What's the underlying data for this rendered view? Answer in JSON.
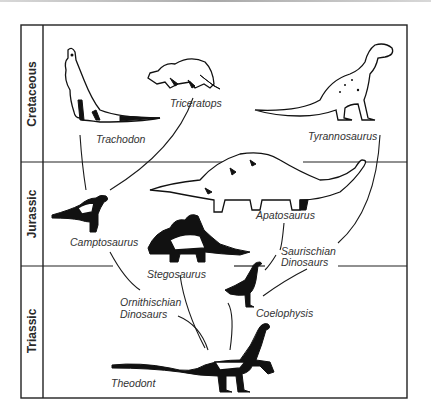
{
  "diagram": {
    "type": "phylogeny",
    "eras": [
      {
        "id": "cretaceous",
        "label": "Cretaceous"
      },
      {
        "id": "jurassic",
        "label": "Jurassic"
      },
      {
        "id": "triassic",
        "label": "Triassic"
      }
    ],
    "species": {
      "trachodon": "Trachodon",
      "triceratops": "Triceratops",
      "tyrannosaurus": "Tyrannosaurus",
      "camptosaurus": "Camptosaurus",
      "apatosaurus": "Apatosaurus",
      "stegosaurus": "Stegosaurus",
      "coelophysis": "Coelophysis",
      "theodont": "Theodont"
    },
    "groups": {
      "ornithischian_line1": "Ornithischian",
      "ornithischian_line2": "Dinosaurs",
      "saurischian_line1": "Saurischian",
      "saurischian_line2": "Dinosaurs"
    },
    "edges": [
      {
        "from": "Theodont",
        "to": "Ornithischian Dinosaurs"
      },
      {
        "from": "Theodont",
        "to": "Saurischian Dinosaurs"
      },
      {
        "from": "Ornithischian Dinosaurs",
        "to": "Camptosaurus"
      },
      {
        "from": "Ornithischian Dinosaurs",
        "to": "Stegosaurus"
      },
      {
        "from": "Camptosaurus",
        "to": "Trachodon"
      },
      {
        "from": "Camptosaurus",
        "to": "Triceratops"
      },
      {
        "from": "Saurischian Dinosaurs",
        "to": "Apatosaurus"
      },
      {
        "from": "Saurischian Dinosaurs",
        "to": "Coelophysis"
      },
      {
        "from": "Saurischian Dinosaurs",
        "to": "Tyrannosaurus"
      }
    ]
  }
}
